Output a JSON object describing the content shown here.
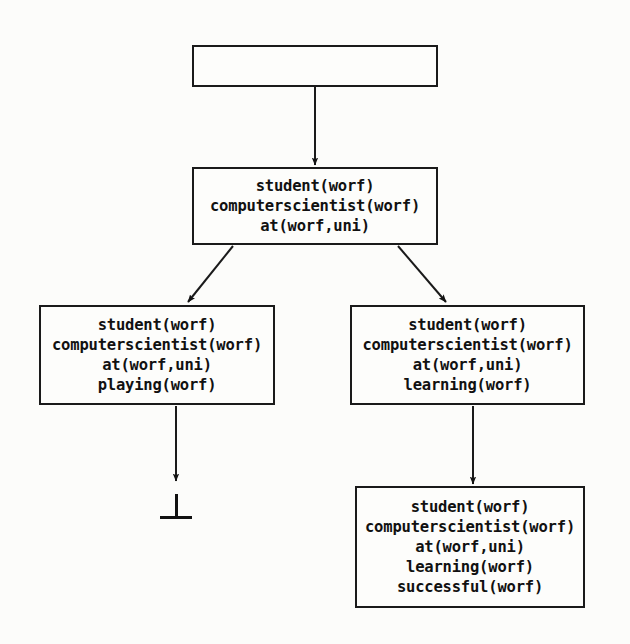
{
  "diagram": {
    "background_color": "#fcfcfa",
    "line_color": "#1a1a1a",
    "text_color": "#111111"
  },
  "nodes": [
    {
      "id": "root",
      "name": "root-node",
      "literals": [],
      "x": 192,
      "y": 45,
      "w": 246,
      "h": 42
    },
    {
      "id": "n1",
      "name": "node-initial-state",
      "literals": [
        "student(worf)",
        "computerscientist(worf)",
        "at(worf,uni)"
      ],
      "x": 192,
      "y": 167,
      "w": 246,
      "h": 78
    },
    {
      "id": "n2",
      "name": "node-playing-branch",
      "literals": [
        "student(worf)",
        "computerscientist(worf)",
        "at(worf,uni)",
        "playing(worf)"
      ],
      "x": 39,
      "y": 305,
      "w": 236,
      "h": 100
    },
    {
      "id": "n3",
      "name": "node-learning-branch",
      "literals": [
        "student(worf)",
        "computerscientist(worf)",
        "at(worf,uni)",
        "learning(worf)"
      ],
      "x": 350,
      "y": 305,
      "w": 235,
      "h": 100
    },
    {
      "id": "n4",
      "name": "node-successful-branch",
      "literals": [
        "student(worf)",
        "computerscientist(worf)",
        "at(worf,uni)",
        "learning(worf)",
        "successful(worf)"
      ],
      "x": 355,
      "y": 486,
      "w": 230,
      "h": 122
    }
  ],
  "edges": [
    {
      "id": "e0",
      "name": "edge-root-to-initial",
      "from": "root",
      "to": "n1",
      "x1": 315,
      "y1": 87,
      "x2": 315,
      "y2": 165,
      "kind": "vertical-arrow"
    },
    {
      "id": "e1",
      "name": "edge-initial-to-playing",
      "from": "n1",
      "to": "n2",
      "x1": 233,
      "y1": 246,
      "x2": 188,
      "y2": 302,
      "kind": "diagonal-arrow"
    },
    {
      "id": "e2",
      "name": "edge-initial-to-learning",
      "from": "n1",
      "to": "n3",
      "x1": 398,
      "y1": 246,
      "x2": 446,
      "y2": 302,
      "kind": "diagonal-arrow"
    },
    {
      "id": "e3",
      "name": "edge-playing-to-falsum",
      "from": "n2",
      "to": "falsum",
      "x1": 176,
      "y1": 406,
      "x2": 176,
      "y2": 481,
      "kind": "vertical-arrow"
    },
    {
      "id": "e4",
      "name": "edge-learning-to-successful",
      "from": "n3",
      "to": "n4",
      "x1": 473,
      "y1": 406,
      "x2": 473,
      "y2": 484,
      "kind": "vertical-arrow"
    }
  ],
  "falsum": {
    "name": "falsum-symbol",
    "glyph": "bottom",
    "label": "⊥",
    "x": 176,
    "y": 494,
    "stem_height": 22,
    "bar_width": 32
  }
}
